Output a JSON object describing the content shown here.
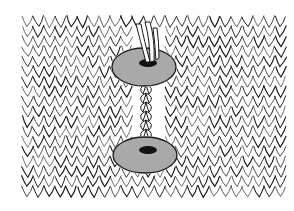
{
  "image": {
    "subject": "Knitted fabric with two disc-shaped buttons joined by a twisted yarn shank",
    "colors": {
      "background": "#ffffff",
      "ink": "#1a1a1a",
      "disc_fill": "#a9a9a9",
      "disc_hole": "#111111"
    },
    "elements": [
      {
        "name": "knit-fabric",
        "description": "vertical columns of V-shaped knit stitches"
      },
      {
        "name": "upper-button-disc",
        "description": "grey oval disc with yarn passing through center hole"
      },
      {
        "name": "lower-button-disc",
        "description": "grey oval disc with yarn passing through center hole"
      },
      {
        "name": "twisted-yarn-shank",
        "description": "twisted yarn linking the discs through the fabric"
      }
    ]
  }
}
